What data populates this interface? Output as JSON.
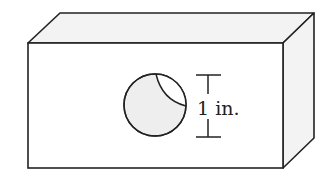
{
  "diagram": {
    "type": "3d-rectangular-block-with-cylindrical-hole",
    "dimension_label": "1 in.",
    "colors": {
      "stroke": "#222222",
      "front_face": "#ffffff",
      "side_face": "#f3f3f3",
      "hole_fill": "#eeeeee",
      "background": "#ffffff"
    },
    "block": {
      "front_face": {
        "x": 28,
        "y": 43,
        "width": 255,
        "height": 125
      },
      "depth_offset": {
        "dx": 31,
        "dy": -30
      }
    },
    "hole": {
      "cx": 155,
      "cy": 105,
      "r": 31
    },
    "dimension": {
      "x": 208,
      "y_top": 75,
      "y_bottom": 137,
      "cap_half_width": 12
    }
  }
}
